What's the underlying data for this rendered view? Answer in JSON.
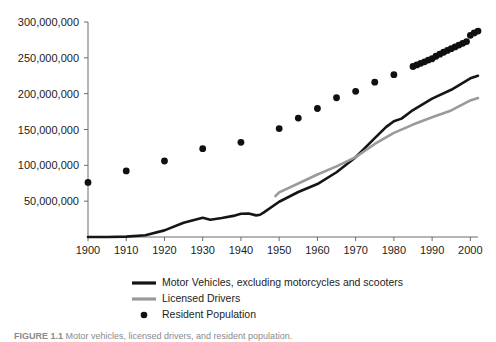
{
  "chart_data": {
    "type": "line",
    "title": "",
    "subtitle": "",
    "xlabel": "",
    "ylabel": "",
    "xlim": [
      1900,
      2002
    ],
    "ylim": [
      0,
      300000000
    ],
    "grid": false,
    "legend_position": "bottom-left",
    "x_ticks": [
      1900,
      1910,
      1920,
      1930,
      1940,
      1950,
      1960,
      1970,
      1980,
      1990,
      2000
    ],
    "x_tick_labels": [
      "1900",
      "1910",
      "1920",
      "1930",
      "1940",
      "1950",
      "1960",
      "1970",
      "1980",
      "1990",
      "2000"
    ],
    "y_ticks": [
      50000000,
      100000000,
      150000000,
      200000000,
      250000000,
      300000000
    ],
    "y_tick_labels": [
      "50,000,000",
      "100,000,000",
      "150,000,000",
      "200,000,000",
      "250,000,000",
      "300,000,000"
    ],
    "series": [
      {
        "name": "Motor Vehicles, excluding motorcycles and scooters",
        "marker": "line",
        "color": "#151515",
        "linewidth": 2.6,
        "x": [
          1900,
          1905,
          1910,
          1915,
          1920,
          1925,
          1930,
          1932,
          1935,
          1938,
          1940,
          1942,
          1944,
          1945,
          1946,
          1950,
          1955,
          1960,
          1965,
          1970,
          1975,
          1978,
          1980,
          1982,
          1985,
          1990,
          1995,
          2000,
          2002
        ],
        "values": [
          8000,
          78000,
          468000,
          2490000,
          9239000,
          19941000,
          26750000,
          24137000,
          26546000,
          29443000,
          32453000,
          32700000,
          30200000,
          31035000,
          34400000,
          49161000,
          62790000,
          73858000,
          90358000,
          111242000,
          137912000,
          153600000,
          161490000,
          165200000,
          177133000,
          193057000,
          205427000,
          221475000,
          225000000
        ]
      },
      {
        "name": "Licensed Drivers",
        "marker": "line",
        "color": "#9a9a9a",
        "linewidth": 2.6,
        "x": [
          1949,
          1950,
          1955,
          1960,
          1965,
          1970,
          1975,
          1980,
          1985,
          1990,
          1995,
          2000,
          2002
        ],
        "values": [
          57000000,
          62194000,
          74700000,
          87253000,
          98502000,
          111543000,
          129791000,
          145295000,
          156868000,
          167015000,
          176628000,
          190625000,
          194000000
        ]
      },
      {
        "name": "Resident Population",
        "marker": "dot",
        "color": "#101010",
        "dot_radius": 3.4,
        "x": [
          1900,
          1910,
          1920,
          1930,
          1940,
          1950,
          1955,
          1960,
          1965,
          1970,
          1975,
          1980,
          1985,
          1986,
          1987,
          1988,
          1989,
          1990,
          1991,
          1992,
          1993,
          1994,
          1995,
          1996,
          1997,
          1998,
          1999,
          2000,
          2001,
          2002
        ],
        "values": [
          76212168,
          92228496,
          106021537,
          123202624,
          132164569,
          151325798,
          165931000,
          179323175,
          194303000,
          203211926,
          215973000,
          226545805,
          237924000,
          240133000,
          242289000,
          244499000,
          246819000,
          248709873,
          252177000,
          255078000,
          257783000,
          260327000,
          262803000,
          265229000,
          267784000,
          270248000,
          272691000,
          281421906,
          284797000,
          287400000
        ]
      }
    ]
  },
  "legend": {
    "items": [
      {
        "label": "Motor Vehicles, excluding motorcycles and scooters",
        "marker": "line",
        "color": "#151515"
      },
      {
        "label": "Licensed Drivers",
        "marker": "line",
        "color": "#9a9a9a"
      },
      {
        "label": "Resident Population",
        "marker": "dot",
        "color": "#101010"
      }
    ]
  },
  "caption": {
    "prefix": "FIGURE 1.1",
    "text": "Motor vehicles, licensed drivers, and resident population."
  }
}
